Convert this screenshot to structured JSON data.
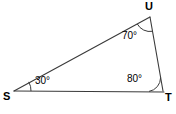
{
  "figure": {
    "type": "triangle-diagram",
    "background_color": "#ffffff",
    "stroke_color": "#3a3a3a",
    "text_color": "#000000",
    "vertices": [
      {
        "name": "S",
        "label": "S",
        "x": 14,
        "y": 91
      },
      {
        "name": "U",
        "label": "U",
        "x": 150,
        "y": 17
      },
      {
        "name": "T",
        "label": "T",
        "x": 163,
        "y": 91
      }
    ],
    "sides": [
      {
        "name": "side-SU",
        "from": "S",
        "to": "U"
      },
      {
        "name": "side-UT",
        "from": "U",
        "to": "T"
      },
      {
        "name": "side-ST",
        "from": "S",
        "to": "T"
      }
    ],
    "angles": [
      {
        "name": "angle-S",
        "vertex": "S",
        "label": "30°",
        "value": 30
      },
      {
        "name": "angle-U",
        "vertex": "U",
        "label": "70°",
        "value": 70
      },
      {
        "name": "angle-T",
        "vertex": "T",
        "label": "80°",
        "value": 80
      }
    ]
  }
}
